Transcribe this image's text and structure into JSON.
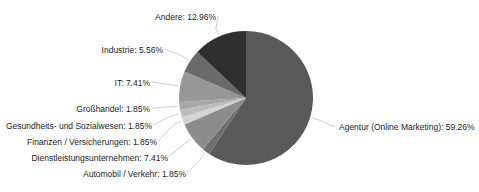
{
  "chart_data": {
    "type": "pie",
    "title": "",
    "start_angle_deg": 0,
    "direction": "clockwise",
    "legend": "none (labels with leader lines)",
    "slices": [
      {
        "label": "Agentur (Online Marketing)",
        "value": 59.26,
        "text": "Agentur (Online Marketing): 59.26%",
        "color": "#595959"
      },
      {
        "label": "Automobil / Verkehr",
        "value": 1.85,
        "text": "Automobil / Verkehr: 1.85%",
        "color": "#6e6e6e"
      },
      {
        "label": "Dienstleistungsunternehmen",
        "value": 7.41,
        "text": "Dienstleistungsunternehmen: 7.41%",
        "color": "#8c8c8c"
      },
      {
        "label": "Finanzen / Versicherungen",
        "value": 1.85,
        "text": "Finanzen / Versicherungen: 1.85%",
        "color": "#d4d4d4"
      },
      {
        "label": "Gesundheits- und Sozialwesen",
        "value": 1.85,
        "text": "Gesundheits- und Sozialwesen: 1.85%",
        "color": "#bdbdbd"
      },
      {
        "label": "Großhandel",
        "value": 1.85,
        "text": "Großhandel: 1.85%",
        "color": "#a8a8a8"
      },
      {
        "label": "IT",
        "value": 7.41,
        "text": "IT: 7.41%",
        "color": "#979797"
      },
      {
        "label": "Industrie",
        "value": 5.56,
        "text": "Industrie: 5.56%",
        "color": "#6a6a6a"
      },
      {
        "label": "Andere",
        "value": 12.96,
        "text": "Andere: 12.96%",
        "color": "#2f2f2f"
      }
    ]
  }
}
